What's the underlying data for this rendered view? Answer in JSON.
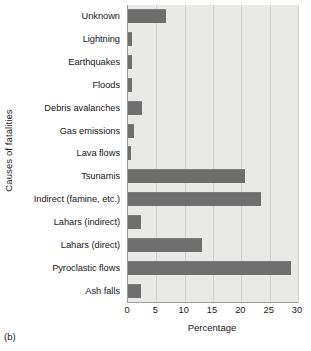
{
  "panel": {
    "caption": "(b)"
  },
  "chart_data": {
    "type": "bar",
    "orientation": "horizontal",
    "title": "",
    "xlabel": "Percentage",
    "ylabel": "Causes of fatalities",
    "xlim": [
      0,
      30
    ],
    "xticks": [
      0,
      5,
      10,
      15,
      20,
      25,
      30
    ],
    "xtick_labels": [
      "0",
      "5",
      "10",
      "15",
      "20",
      "25",
      "30"
    ],
    "grid": true,
    "grid_axis": "x",
    "legend": false,
    "plot_background": "#e9e9e7",
    "bar_color": "#6e6e6e",
    "categories": [
      "Unknown",
      "Lightning",
      "Earthquakes",
      "Floods",
      "Debris  avalanches",
      "Gas emissions",
      "Lava flows",
      "Tsunamis",
      "Indirect (famine, etc.)",
      "Lahars (indirect)",
      "Lahars (direct)",
      "Pyroclastic flows",
      "Ash falls"
    ],
    "values": [
      6.7,
      0.7,
      0.7,
      0.7,
      2.4,
      1.1,
      0.6,
      20.7,
      23.4,
      2.3,
      13.0,
      28.8,
      2.3
    ]
  }
}
